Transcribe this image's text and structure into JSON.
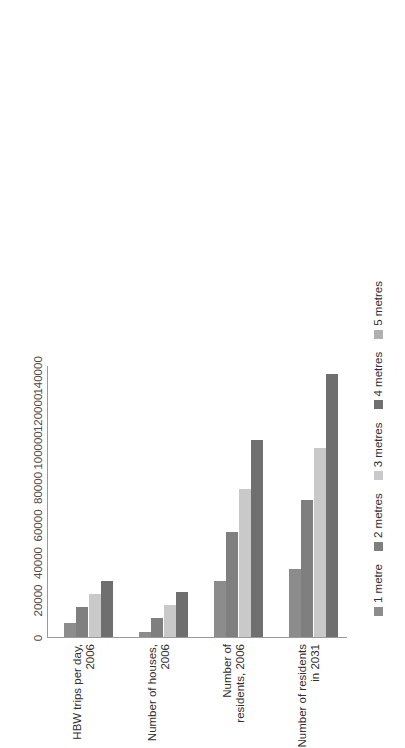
{
  "chart_data": {
    "type": "bar",
    "orientation": "horizontal",
    "title": "",
    "xlabel": "",
    "ylabel": "",
    "xlim": [
      0,
      145000
    ],
    "grid": false,
    "legend_position": "bottom",
    "rotation_degrees": -90,
    "categories": [
      "HBW trips per day, 2006",
      "Number of houses, 2006",
      "Number of residents, 2006",
      "Number of residents in 2031"
    ],
    "tick_labels": [
      "0",
      "20000",
      "40000",
      "60000",
      "80000",
      "100000",
      "120000",
      "140000"
    ],
    "tick_values": [
      0,
      20000,
      40000,
      60000,
      80000,
      100000,
      120000,
      140000
    ],
    "series": [
      {
        "name": "1 metre",
        "color": "#8c8c8c",
        "values": [
          7500,
          2500,
          30000,
          36000
        ]
      },
      {
        "name": "2 metres",
        "color": "#7f7f7f",
        "values": [
          16000,
          10000,
          56000,
          73000
        ]
      },
      {
        "name": "3 metres",
        "color": "#c9c9c9",
        "values": [
          23000,
          17000,
          79000,
          101000
        ]
      },
      {
        "name": "4 metres",
        "color": "#6f6f6f",
        "values": [
          30000,
          24000,
          105000,
          140000
        ]
      },
      {
        "name": "5 metres",
        "color": "#b0b0b0",
        "values": [
          null,
          null,
          null,
          null
        ]
      }
    ],
    "legend_entries": [
      "1 metre",
      "2 metres",
      "3 metres",
      "4 metres",
      "5 metres"
    ],
    "legend_colors": [
      "#8c8c8c",
      "#7f7f7f",
      "#c9c9c9",
      "#6f6f6f",
      "#b0b0b0"
    ]
  }
}
